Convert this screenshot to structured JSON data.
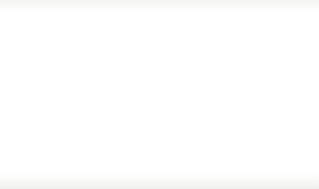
{
  "chart_data": {
    "type": "bar",
    "title": "",
    "subtitle": "",
    "xlabel": "",
    "ylabel": "Population (millions)",
    "categories": [
      "1990",
      "2000",
      "2010",
      "2025"
    ],
    "series": [
      {
        "name": "Total",
        "color": "#0b0b0b",
        "values": [
          845,
          880,
          925,
          970
        ]
      },
      {
        "name": "<60",
        "color": "#b4b4b4",
        "values": [
          145,
          170,
          180,
          225
        ]
      }
    ],
    "ylim": [
      0,
      1000
    ],
    "ytick_labels": [
      "0",
      "200",
      "400",
      "600",
      "800",
      "1000"
    ],
    "ytick_values": [
      0,
      200,
      400,
      600,
      800,
      1000
    ],
    "minor_tick_step": 100,
    "grid": false,
    "legend_position": "right"
  },
  "legend": {
    "entries": [
      {
        "label": "Total",
        "color": "#0b0b0b"
      },
      {
        "label": "<60",
        "color": "#b4b4b4"
      }
    ]
  }
}
